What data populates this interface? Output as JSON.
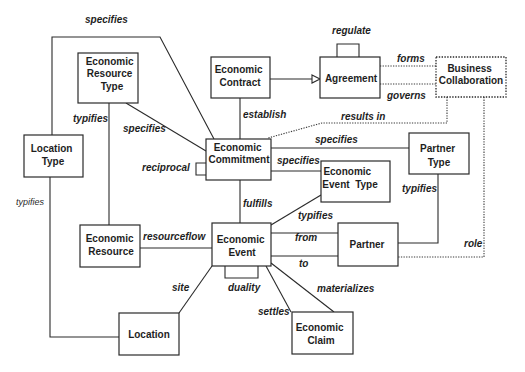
{
  "diagram": {
    "entities": [
      {
        "name": "economic-resource-type",
        "lines": [
          "Economic",
          "Resource",
          "Type"
        ]
      },
      {
        "name": "economic-contract",
        "lines": [
          "Economic",
          "Contract"
        ]
      },
      {
        "name": "agreement",
        "lines": [
          "Agreement"
        ]
      },
      {
        "name": "business-collaboration",
        "lines": [
          "Business",
          "Collaboration"
        ]
      },
      {
        "name": "location-type",
        "lines": [
          "Location",
          "Type"
        ]
      },
      {
        "name": "economic-commitment",
        "lines": [
          "Economic",
          "Commitment"
        ]
      },
      {
        "name": "partner-type",
        "lines": [
          "Partner",
          "Type"
        ]
      },
      {
        "name": "economic-event-type",
        "lines": [
          "Economic",
          "Event  Type"
        ]
      },
      {
        "name": "economic-resource",
        "lines": [
          "Economic",
          "Resource"
        ]
      },
      {
        "name": "economic-event",
        "lines": [
          "Economic",
          "Event"
        ]
      },
      {
        "name": "partner",
        "lines": [
          "Partner"
        ]
      },
      {
        "name": "location",
        "lines": [
          "Location"
        ]
      },
      {
        "name": "economic-claim",
        "lines": [
          "Economic",
          "Claim"
        ]
      }
    ],
    "relationships": [
      {
        "label": "specifies",
        "from": "Location Type",
        "to": "Economic Commitment",
        "style": "solid"
      },
      {
        "label": "specifies",
        "from": "Economic Resource Type",
        "to": "Economic Commitment",
        "style": "solid"
      },
      {
        "label": "typifies",
        "from": "Economic Resource Type",
        "to": "Economic Resource",
        "style": "solid"
      },
      {
        "label": "typifies",
        "from": "Location Type",
        "to": "Location",
        "style": "solid"
      },
      {
        "label": "establish",
        "from": "Economic Contract",
        "to": "Economic Commitment",
        "style": "solid"
      },
      {
        "label": "regulate",
        "from": "Agreement",
        "to": "Agreement",
        "style": "self-loop"
      },
      {
        "label": "forms",
        "from": "Agreement",
        "to": "Business Collaboration",
        "style": "dotted"
      },
      {
        "label": "governs",
        "from": "Agreement",
        "to": "Business Collaboration",
        "style": "dotted"
      },
      {
        "label": "results in",
        "from": "Business Collaboration",
        "to": "Economic Commitment",
        "style": "dotted"
      },
      {
        "label": "role",
        "from": "Business Collaboration",
        "to": "Partner",
        "style": "dotted"
      },
      {
        "label": "specifies",
        "from": "Economic Commitment",
        "to": "Partner Type",
        "style": "solid"
      },
      {
        "label": "specifies",
        "from": "Economic Commitment",
        "to": "Economic Event Type",
        "style": "solid"
      },
      {
        "label": "reciprocal",
        "from": "Economic Commitment",
        "to": "Economic Commitment",
        "style": "self-loop"
      },
      {
        "label": "fulfills",
        "from": "Economic Commitment",
        "to": "Economic Event",
        "style": "solid"
      },
      {
        "label": "typifies",
        "from": "Economic Event Type",
        "to": "Economic Event",
        "style": "solid"
      },
      {
        "label": "typifies",
        "from": "Partner Type",
        "to": "Partner",
        "style": "solid"
      },
      {
        "label": "from",
        "from": "Economic Event",
        "to": "Partner",
        "style": "solid"
      },
      {
        "label": "to",
        "from": "Economic Event",
        "to": "Partner",
        "style": "solid"
      },
      {
        "label": "resourceflow",
        "from": "Economic Resource",
        "to": "Economic Event",
        "style": "solid"
      },
      {
        "label": "duality",
        "from": "Economic Event",
        "to": "Economic Event",
        "style": "self-loop"
      },
      {
        "label": "site",
        "from": "Economic Event",
        "to": "Location",
        "style": "solid"
      },
      {
        "label": "settles",
        "from": "Economic Event",
        "to": "Economic Claim",
        "style": "solid"
      },
      {
        "label": "materializes",
        "from": "Economic Event",
        "to": "Economic Claim",
        "style": "solid"
      }
    ],
    "generalization": {
      "from": "Economic Contract",
      "to": "Agreement",
      "arrow": "hollow-triangle"
    },
    "colors": {
      "stroke": "#2a2a2a",
      "text": "#1e1e1e",
      "background": "#ffffff"
    }
  }
}
